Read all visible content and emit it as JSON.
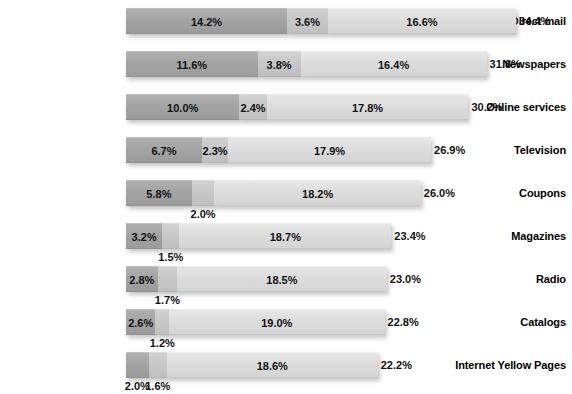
{
  "chart_data": {
    "type": "bar",
    "subtype": "stacked-horizontal-bar",
    "title": "",
    "xlabel": "",
    "ylabel": "",
    "grid": false,
    "legend_position": "none",
    "axis_visible": false,
    "value_suffix": "%",
    "xlim": [
      0,
      34.4
    ],
    "categories": [
      "Direct mail",
      "Newspapers",
      "Online services",
      "Television",
      "Coupons",
      "Magazines",
      "Radio",
      "Catalogs",
      "Internet Yellow Pages"
    ],
    "series": [
      {
        "name": "Segment 1",
        "color": "#a4a4a4",
        "values": [
          14.2,
          11.6,
          10.0,
          6.7,
          5.8,
          3.2,
          2.8,
          2.6,
          2.0
        ]
      },
      {
        "name": "Segment 2",
        "color": "#c8c8c8",
        "values": [
          3.6,
          3.8,
          2.4,
          2.3,
          2.0,
          1.5,
          1.7,
          1.2,
          1.6
        ]
      },
      {
        "name": "Segment 3",
        "color": "#dddddd",
        "values": [
          16.6,
          16.4,
          17.8,
          17.9,
          18.2,
          18.7,
          18.5,
          19.0,
          18.6
        ]
      }
    ],
    "totals": [
      34.4,
      31.8,
      30.2,
      26.9,
      26.0,
      23.4,
      23.0,
      22.8,
      22.2
    ]
  },
  "rows": [
    {
      "label": "Direct mail",
      "segments": [
        {
          "value": 14.2,
          "label": "14.2%",
          "tone": 1,
          "label_placement": "inside"
        },
        {
          "value": 3.6,
          "label": "3.6%",
          "tone": 2,
          "label_placement": "inside"
        },
        {
          "value": 16.6,
          "label": "16.6%",
          "tone": 3,
          "label_placement": "inside"
        }
      ],
      "total": 34.4,
      "total_label": "34.4%"
    },
    {
      "label": "Newspapers",
      "segments": [
        {
          "value": 11.6,
          "label": "11.6%",
          "tone": 1,
          "label_placement": "inside"
        },
        {
          "value": 3.8,
          "label": "3.8%",
          "tone": 2,
          "label_placement": "inside"
        },
        {
          "value": 16.4,
          "label": "16.4%",
          "tone": 3,
          "label_placement": "inside"
        }
      ],
      "total": 31.8,
      "total_label": "31.8%"
    },
    {
      "label": "Online services",
      "segments": [
        {
          "value": 10.0,
          "label": "10.0%",
          "tone": 1,
          "label_placement": "inside"
        },
        {
          "value": 2.4,
          "label": "2.4%",
          "tone": 2,
          "label_placement": "inside"
        },
        {
          "value": 17.8,
          "label": "17.8%",
          "tone": 3,
          "label_placement": "inside"
        }
      ],
      "total": 30.2,
      "total_label": "30.2%"
    },
    {
      "label": "Television",
      "segments": [
        {
          "value": 6.7,
          "label": "6.7%",
          "tone": 1,
          "label_placement": "inside"
        },
        {
          "value": 2.3,
          "label": "2.3%",
          "tone": 2,
          "label_placement": "inside"
        },
        {
          "value": 17.9,
          "label": "17.9%",
          "tone": 3,
          "label_placement": "inside"
        }
      ],
      "total": 26.9,
      "total_label": "26.9%"
    },
    {
      "label": "Coupons",
      "segments": [
        {
          "value": 5.8,
          "label": "5.8%",
          "tone": 1,
          "label_placement": "inside"
        },
        {
          "value": 2.0,
          "label": "2.0%",
          "tone": 2,
          "label_placement": "below"
        },
        {
          "value": 18.2,
          "label": "18.2%",
          "tone": 3,
          "label_placement": "inside"
        }
      ],
      "total": 26.0,
      "total_label": "26.0%"
    },
    {
      "label": "Magazines",
      "segments": [
        {
          "value": 3.2,
          "label": "3.2%",
          "tone": 1,
          "label_placement": "inside"
        },
        {
          "value": 1.5,
          "label": "1.5%",
          "tone": 2,
          "label_placement": "below"
        },
        {
          "value": 18.7,
          "label": "18.7%",
          "tone": 3,
          "label_placement": "inside"
        }
      ],
      "total": 23.4,
      "total_label": "23.4%"
    },
    {
      "label": "Radio",
      "segments": [
        {
          "value": 2.8,
          "label": "2.8%",
          "tone": 1,
          "label_placement": "inside"
        },
        {
          "value": 1.7,
          "label": "1.7%",
          "tone": 2,
          "label_placement": "below"
        },
        {
          "value": 18.5,
          "label": "18.5%",
          "tone": 3,
          "label_placement": "inside"
        }
      ],
      "total": 23.0,
      "total_label": "23.0%"
    },
    {
      "label": "Catalogs",
      "segments": [
        {
          "value": 2.6,
          "label": "2.6%",
          "tone": 1,
          "label_placement": "inside"
        },
        {
          "value": 1.2,
          "label": "1.2%",
          "tone": 2,
          "label_placement": "below"
        },
        {
          "value": 19.0,
          "label": "19.0%",
          "tone": 3,
          "label_placement": "inside"
        }
      ],
      "total": 22.8,
      "total_label": "22.8%"
    },
    {
      "label": "Internet Yellow Pages",
      "segments": [
        {
          "value": 2.0,
          "label": "2.0%",
          "tone": 1,
          "label_placement": "below"
        },
        {
          "value": 1.6,
          "label": "1.6%",
          "tone": 2,
          "label_placement": "below"
        },
        {
          "value": 18.6,
          "label": "18.6%",
          "tone": 3,
          "label_placement": "inside"
        }
      ],
      "total": 22.2,
      "total_label": "22.2%"
    }
  ],
  "layout": {
    "bar_origin_x": 126,
    "px_per_unit": 11.34,
    "row_height": 43,
    "first_row_top": 8,
    "bar_height": 26,
    "label_column_width": 122
  },
  "colors": {
    "segment_1": "#a4a4a4",
    "segment_2": "#c8c8c8",
    "segment_3": "#dddddd",
    "text": "#111111",
    "background": "#ffffff"
  }
}
